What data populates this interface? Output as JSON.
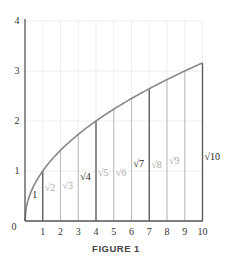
{
  "figure": {
    "caption": "FIGURE 1"
  },
  "chart_data": {
    "type": "line",
    "title": "FIGURE 1",
    "function": "y = sqrt(x)",
    "xlabel": "",
    "ylabel": "",
    "xlim": [
      0,
      10
    ],
    "ylim": [
      0,
      4
    ],
    "grid": true,
    "x_ticks": [
      "1",
      "2",
      "3",
      "4",
      "5",
      "6",
      "7",
      "8",
      "9",
      "10"
    ],
    "y_ticks": [
      "0",
      "1",
      "2",
      "3",
      "4"
    ],
    "x": [
      1,
      2,
      3,
      4,
      5,
      6,
      7,
      8,
      9,
      10
    ],
    "values": [
      1,
      1.414,
      1.732,
      2,
      2.236,
      2.449,
      2.646,
      2.828,
      3,
      3.162
    ],
    "vertical_segments": [
      {
        "x": 1,
        "label": "1",
        "emphasis": true
      },
      {
        "x": 2,
        "label": "√2",
        "emphasis": false
      },
      {
        "x": 3,
        "label": "√3",
        "emphasis": false
      },
      {
        "x": 4,
        "label": "√4",
        "emphasis": true
      },
      {
        "x": 5,
        "label": "√5",
        "emphasis": false
      },
      {
        "x": 6,
        "label": "√6",
        "emphasis": false
      },
      {
        "x": 7,
        "label": "√7",
        "emphasis": true
      },
      {
        "x": 8,
        "label": "√8",
        "emphasis": false
      },
      {
        "x": 9,
        "label": "√9",
        "emphasis": false
      },
      {
        "x": 10,
        "label": "√10",
        "emphasis": true
      }
    ],
    "colors": {
      "axis": "#555555",
      "curve": "#888888",
      "grid": "#eeeeee",
      "emphasis_line": "#555555",
      "light_line": "#bbbbbb",
      "emphasis_label": "#222222",
      "light_label": "#aaaaaa"
    }
  }
}
